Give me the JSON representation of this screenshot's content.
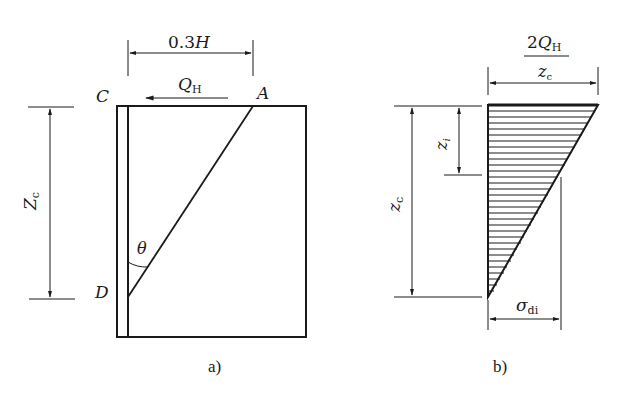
{
  "figure_a": {
    "caption": "a)",
    "dim_top": {
      "text": "0.3",
      "var": "H"
    },
    "force": {
      "var": "Q",
      "sub": "H"
    },
    "point_c": "C",
    "point_a": "A",
    "point_d": "D",
    "angle": "θ",
    "dim_left": {
      "var": "Z",
      "sub": "c"
    }
  },
  "figure_b": {
    "caption": "b)",
    "top_value": {
      "numerator_coef": "2",
      "numerator_var": "Q",
      "numerator_sub": "H",
      "denominator_var": "z",
      "denominator_sub": "c"
    },
    "dim_outer": {
      "var": "z",
      "sub": "c"
    },
    "dim_inner": {
      "var": "z",
      "sub": "i"
    },
    "bottom_value": {
      "var": "σ",
      "sub": "di"
    }
  },
  "colors": {
    "ink": "#1a1a1a",
    "background": "#ffffff"
  }
}
